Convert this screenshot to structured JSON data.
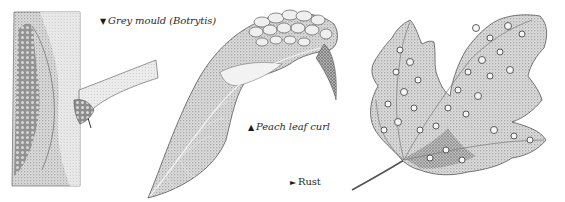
{
  "plate": {
    "background": "#ffffff",
    "ink_color": "#3a3a3a"
  },
  "captions": {
    "grey_mould": {
      "marker": "▼",
      "marker_icon": "down-triangle-icon",
      "text": "Grey mould (Botrytis)"
    },
    "peach_leaf_curl": {
      "marker": "▲",
      "marker_icon": "up-triangle-icon",
      "text": "Peach leaf curl"
    },
    "rust": {
      "marker": "►",
      "marker_icon": "right-triangle-icon",
      "text": "Rust"
    }
  },
  "illustrations": [
    {
      "name": "grey-mould-stem",
      "subject": "Grey mould (Botrytis)"
    },
    {
      "name": "peach-leaf-curl-leaf",
      "subject": "Peach leaf curl"
    },
    {
      "name": "rust-leaf",
      "subject": "Rust"
    }
  ]
}
